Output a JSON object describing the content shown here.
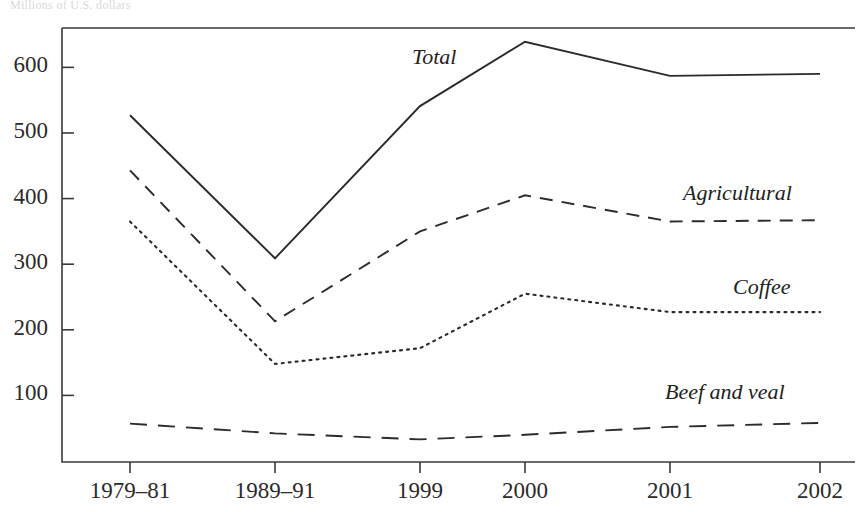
{
  "title": "Millions of U.S. dollars",
  "chart_data": {
    "type": "line",
    "title": "Millions of U.S. dollars",
    "xlabel": "",
    "ylabel": "",
    "categories": [
      "1979–81",
      "1989–91",
      "1999",
      "2000",
      "2001",
      "2002"
    ],
    "yticks": [
      100,
      200,
      300,
      400,
      500,
      600
    ],
    "ylim": [
      0,
      660
    ],
    "grid": false,
    "legend_position": "inline-right",
    "series": [
      {
        "name": "Total",
        "style": "solid",
        "values": [
          527,
          309,
          541,
          639,
          587,
          590
        ]
      },
      {
        "name": "Agricultural",
        "style": "dashed",
        "values": [
          443,
          213,
          350,
          405,
          365,
          367
        ]
      },
      {
        "name": "Coffee",
        "style": "dotted",
        "values": [
          365,
          148,
          172,
          255,
          227,
          227
        ]
      },
      {
        "name": "Beef and veal",
        "style": "long-dashed",
        "values": [
          57,
          42,
          33,
          40,
          52,
          58
        ]
      }
    ]
  },
  "axis": {
    "y_tick_labels": [
      "600",
      "500",
      "400",
      "300",
      "200",
      "100"
    ],
    "x_tick_labels": [
      "1979–81",
      "1989–91",
      "1999",
      "2000",
      "2001",
      "2002"
    ]
  },
  "series_labels": {
    "total": "Total",
    "agricultural": "Agricultural",
    "coffee": "Coffee",
    "beef_and_veal": "Beef and veal"
  },
  "colors": {
    "ink": "#2b2b2b",
    "frame": "#3a3a3a",
    "background": "#ffffff"
  }
}
